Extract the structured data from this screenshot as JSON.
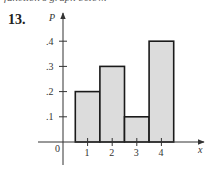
{
  "header": {
    "cutoff_text": "function's graph below.",
    "problem_number": "13."
  },
  "colors": {
    "bar_fill": "#dcdcdc",
    "bar_stroke": "#1a1a1a",
    "axis": "#333333"
  },
  "chart_data": {
    "type": "bar",
    "title": "",
    "xlabel": "x",
    "ylabel": "P",
    "categories": [
      "1",
      "2",
      "3",
      "4"
    ],
    "values": [
      0.2,
      0.3,
      0.1,
      0.4
    ],
    "x_ticks": [
      "1",
      "2",
      "3",
      "4"
    ],
    "y_ticks": [
      ".1",
      ".2",
      ".3",
      ".4"
    ],
    "origin_label": "0",
    "ylim": [
      0,
      0.4
    ],
    "xlim": [
      0,
      4.5
    ],
    "grid": false,
    "legend": null,
    "bar_style": "histogram, contiguous bars centered on integers, width 1"
  }
}
